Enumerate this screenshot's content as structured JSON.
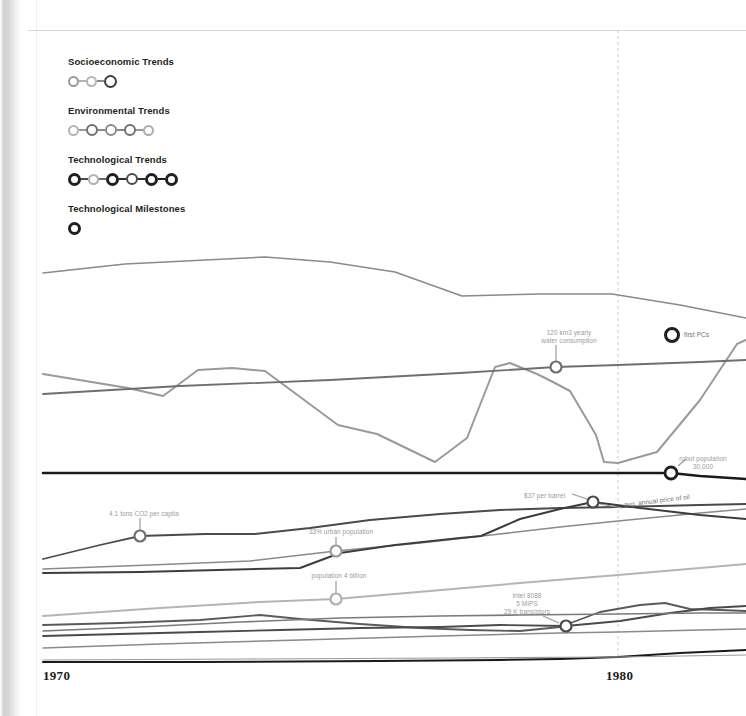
{
  "legend": {
    "blocks": [
      {
        "label": "Socioeconomic Trends",
        "nodes": [
          {
            "d": 11,
            "stroke": 2.0,
            "color": "#9a9a9a"
          },
          {
            "d": 11,
            "stroke": 2.0,
            "color": "#b5b5b5"
          },
          {
            "d": 13,
            "stroke": 2.6,
            "color": "#3d3d3d"
          }
        ],
        "connectors": [
          "#b0b0b0",
          "#8d8d8d"
        ]
      },
      {
        "label": "Environmental Trends",
        "nodes": [
          {
            "d": 11,
            "stroke": 2.0,
            "color": "#b5b5b5"
          },
          {
            "d": 12,
            "stroke": 2.3,
            "color": "#6f6f6f"
          },
          {
            "d": 12,
            "stroke": 2.2,
            "color": "#8a8a8a"
          },
          {
            "d": 12,
            "stroke": 2.3,
            "color": "#6f6f6f"
          },
          {
            "d": 11,
            "stroke": 2.0,
            "color": "#adadad"
          }
        ],
        "connectors": [
          "#9a9a9a",
          "#8a8a8a",
          "#8a8a8a",
          "#9a9a9a"
        ]
      },
      {
        "label": "Technological Trends",
        "nodes": [
          {
            "d": 13,
            "stroke": 3.0,
            "color": "#1f1f1f"
          },
          {
            "d": 11,
            "stroke": 2.0,
            "color": "#b0b0b0"
          },
          {
            "d": 13,
            "stroke": 3.0,
            "color": "#1f1f1f"
          },
          {
            "d": 12,
            "stroke": 2.5,
            "color": "#4a4a4a"
          },
          {
            "d": 13,
            "stroke": 3.0,
            "color": "#1f1f1f"
          },
          {
            "d": 13,
            "stroke": 3.0,
            "color": "#1f1f1f"
          }
        ],
        "connectors": [
          "#4a4a4a",
          "#6a6a6a",
          "#2b2b2b",
          "#2b2b2b",
          "#1f1f1f"
        ]
      },
      {
        "label": "Technological Milestones",
        "nodes": [
          {
            "d": 13,
            "stroke": 3.0,
            "color": "#1f1f1f"
          }
        ],
        "connectors": []
      }
    ]
  },
  "axis": {
    "ticks": [
      {
        "label": "1970",
        "x": 43,
        "y": 668
      },
      {
        "label": "1980",
        "x": 606,
        "y": 668
      }
    ],
    "gridline_x": 618,
    "gridline_color": "#cdcdcd"
  },
  "annotations": [
    {
      "name": "water-consumption",
      "text": "120 km3 yearly\nwater consumption",
      "x": 520,
      "y": 329,
      "w": 98,
      "marker": {
        "x": 556,
        "y": 367,
        "d": 11,
        "stroke": 2.2,
        "color": "#6f6f6f"
      },
      "stem": {
        "x1": 556,
        "y1": 345,
        "x2": 556,
        "y2": 362
      }
    },
    {
      "name": "first-pcs",
      "text": "first PCs",
      "x": 684,
      "y": 331,
      "w": 60,
      "align": "left",
      "tone": "dark",
      "marker": {
        "x": 672,
        "y": 335,
        "d": 13,
        "stroke": 3.0,
        "color": "#1f1f1f"
      },
      "stem": null
    },
    {
      "name": "robot-population",
      "text": "robot population\n30,000",
      "x": 660,
      "y": 455,
      "w": 86,
      "marker": {
        "x": 671,
        "y": 473,
        "d": 12,
        "stroke": 2.8,
        "color": "#1f1f1f"
      },
      "stem": {
        "x1": 678,
        "y1": 466,
        "x2": 686,
        "y2": 459
      }
    },
    {
      "name": "price-per-barrel",
      "text": "$37 per barrel",
      "x": 524,
      "y": 492,
      "w": 66,
      "align": "left",
      "marker": {
        "x": 593,
        "y": 502,
        "d": 11,
        "stroke": 2.2,
        "color": "#4a4a4a"
      },
      "stem": {
        "x1": 572,
        "y1": 494,
        "x2": 587,
        "y2": 499
      }
    },
    {
      "name": "avg-annual-price-of-oil",
      "text": "avg. annual price of oil",
      "x": 624,
      "y": 501,
      "w": 80,
      "align": "left",
      "tone": "dark",
      "rotate": true,
      "marker": null,
      "stem": {
        "x1": 600,
        "y1": 504,
        "x2": 622,
        "y2": 508
      }
    },
    {
      "name": "co2-per-capita",
      "text": "4.1 tons CO2 per capita",
      "x": 95,
      "y": 510,
      "w": 98,
      "marker": {
        "x": 140,
        "y": 536,
        "d": 11,
        "stroke": 2.2,
        "color": "#6f6f6f"
      },
      "stem": {
        "x1": 140,
        "y1": 518,
        "x2": 140,
        "y2": 531
      }
    },
    {
      "name": "urban-population",
      "text": "33% urban population",
      "x": 295,
      "y": 528,
      "w": 92,
      "marker": {
        "x": 336,
        "y": 551,
        "d": 11,
        "stroke": 2.2,
        "color": "#9a9a9a"
      },
      "stem": {
        "x1": 336,
        "y1": 537,
        "x2": 336,
        "y2": 546
      }
    },
    {
      "name": "world-population",
      "text": "population 4 billion",
      "x": 296,
      "y": 572,
      "w": 86,
      "marker": {
        "x": 336,
        "y": 599,
        "d": 11,
        "stroke": 2.2,
        "color": "#b0b0b0"
      },
      "stem": {
        "x1": 336,
        "y1": 581,
        "x2": 336,
        "y2": 594
      }
    },
    {
      "name": "intel-8088",
      "text": "Intel 8088\n5 MIPS\n29 K transistors",
      "x": 487,
      "y": 592,
      "w": 80,
      "marker": {
        "x": 566,
        "y": 626,
        "d": 11,
        "stroke": 2.2,
        "color": "#4a4a4a"
      },
      "stem": {
        "x1": 543,
        "y1": 616,
        "x2": 559,
        "y2": 623
      }
    }
  ],
  "chart_data": {
    "type": "line",
    "title": "",
    "xlabel": "",
    "ylabel": "",
    "xlim": [
      1970,
      1981
    ],
    "grid": false,
    "legend_position": "top-left",
    "x_pixel_range": [
      43,
      746
    ],
    "series": [
      {
        "name": "upper-grey-trend",
        "color": "#8a8a8a",
        "width": 1.6,
        "points": [
          [
            43,
            273
          ],
          [
            125,
            264
          ],
          [
            265,
            257
          ],
          [
            330,
            262
          ],
          [
            395,
            272
          ],
          [
            462,
            296
          ],
          [
            540,
            294
          ],
          [
            612,
            294
          ],
          [
            680,
            305
          ],
          [
            746,
            318
          ]
        ]
      },
      {
        "name": "water-consumption-zigzag",
        "color": "#9a9a9a",
        "width": 2.0,
        "points": [
          [
            43,
            374
          ],
          [
            128,
            388
          ],
          [
            163,
            396
          ],
          [
            198,
            370
          ],
          [
            232,
            368
          ],
          [
            265,
            371
          ],
          [
            338,
            425
          ],
          [
            377,
            434
          ],
          [
            435,
            462
          ],
          [
            467,
            438
          ],
          [
            495,
            367
          ],
          [
            510,
            363
          ],
          [
            537,
            374
          ],
          [
            551,
            381
          ],
          [
            570,
            391
          ],
          [
            596,
            435
          ],
          [
            604,
            462
          ],
          [
            618,
            463
          ],
          [
            657,
            452
          ],
          [
            700,
            400
          ],
          [
            737,
            344
          ],
          [
            746,
            340
          ]
        ]
      },
      {
        "name": "mid-grey-baseline",
        "color": "#6f6f6f",
        "width": 1.8,
        "points": [
          [
            43,
            394
          ],
          [
            180,
            386
          ],
          [
            330,
            380
          ],
          [
            460,
            373
          ],
          [
            556,
            367
          ],
          [
            618,
            365
          ],
          [
            700,
            362
          ],
          [
            746,
            360
          ]
        ]
      },
      {
        "name": "robot-population",
        "color": "#1a1a1a",
        "width": 2.6,
        "points": [
          [
            43,
            473
          ],
          [
            300,
            473
          ],
          [
            500,
            473
          ],
          [
            618,
            473
          ],
          [
            671,
            473
          ],
          [
            700,
            476
          ],
          [
            746,
            479
          ]
        ]
      },
      {
        "name": "co2-per-capita",
        "color": "#4a4a4a",
        "width": 1.8,
        "points": [
          [
            43,
            559
          ],
          [
            100,
            545
          ],
          [
            140,
            536
          ],
          [
            205,
            534
          ],
          [
            255,
            534
          ],
          [
            310,
            528
          ],
          [
            370,
            520
          ],
          [
            440,
            514
          ],
          [
            500,
            510
          ],
          [
            560,
            508
          ],
          [
            618,
            507
          ],
          [
            700,
            505
          ],
          [
            746,
            504
          ]
        ]
      },
      {
        "name": "urban-population",
        "color": "#8a8a8a",
        "width": 1.6,
        "points": [
          [
            43,
            569
          ],
          [
            150,
            565
          ],
          [
            250,
            561
          ],
          [
            336,
            551
          ],
          [
            420,
            543
          ],
          [
            500,
            534
          ],
          [
            560,
            527
          ],
          [
            618,
            521
          ],
          [
            700,
            513
          ],
          [
            746,
            509
          ]
        ]
      },
      {
        "name": "gdp-trend",
        "color": "#3d3d3d",
        "width": 2.0,
        "points": [
          [
            43,
            573
          ],
          [
            140,
            572
          ],
          [
            218,
            570
          ],
          [
            300,
            568
          ],
          [
            340,
            553
          ],
          [
            395,
            545
          ],
          [
            460,
            538
          ],
          [
            481,
            536
          ],
          [
            520,
            519
          ],
          [
            560,
            509
          ],
          [
            593,
            502
          ],
          [
            640,
            508
          ],
          [
            700,
            515
          ],
          [
            746,
            519
          ]
        ]
      },
      {
        "name": "world-population",
        "color": "#b5b5b5",
        "width": 2.0,
        "points": [
          [
            43,
            616
          ],
          [
            160,
            608
          ],
          [
            260,
            602
          ],
          [
            336,
            599
          ],
          [
            430,
            591
          ],
          [
            520,
            583
          ],
          [
            618,
            575
          ],
          [
            700,
            568
          ],
          [
            746,
            564
          ]
        ]
      },
      {
        "name": "compute-power",
        "color": "#5a5a5a",
        "width": 1.8,
        "points": [
          [
            43,
            625
          ],
          [
            120,
            623
          ],
          [
            200,
            620
          ],
          [
            260,
            615
          ],
          [
            300,
            619
          ],
          [
            360,
            624
          ],
          [
            420,
            628
          ],
          [
            470,
            630
          ],
          [
            520,
            631
          ],
          [
            560,
            627
          ],
          [
            600,
            612
          ],
          [
            640,
            605
          ],
          [
            665,
            603
          ],
          [
            690,
            609
          ],
          [
            720,
            610
          ],
          [
            746,
            611
          ]
        ]
      },
      {
        "name": "transistor-count",
        "color": "#4a4a4a",
        "width": 1.8,
        "points": [
          [
            43,
            636
          ],
          [
            120,
            634
          ],
          [
            200,
            632
          ],
          [
            280,
            630
          ],
          [
            360,
            628
          ],
          [
            440,
            627
          ],
          [
            500,
            625
          ],
          [
            566,
            626
          ],
          [
            620,
            621
          ],
          [
            670,
            613
          ],
          [
            710,
            608
          ],
          [
            746,
            606
          ]
        ]
      },
      {
        "name": "mips-line",
        "color": "#7a7a7a",
        "width": 1.6,
        "points": [
          [
            43,
            631
          ],
          [
            140,
            627
          ],
          [
            240,
            622
          ],
          [
            340,
            618
          ],
          [
            440,
            616
          ],
          [
            520,
            615
          ],
          [
            618,
            614
          ],
          [
            700,
            613
          ],
          [
            746,
            613
          ]
        ]
      },
      {
        "name": "lower-thin-line",
        "color": "#8a8a8a",
        "width": 1.4,
        "points": [
          [
            43,
            648
          ],
          [
            160,
            644
          ],
          [
            300,
            640
          ],
          [
            440,
            636
          ],
          [
            560,
            633
          ],
          [
            618,
            632
          ],
          [
            700,
            630
          ],
          [
            746,
            629
          ]
        ]
      },
      {
        "name": "baseline-black",
        "color": "#1a1a1a",
        "width": 2.0,
        "points": [
          [
            43,
            662
          ],
          [
            200,
            662
          ],
          [
            380,
            661
          ],
          [
            500,
            660
          ],
          [
            560,
            659
          ],
          [
            618,
            657
          ],
          [
            680,
            653
          ],
          [
            746,
            650
          ]
        ]
      },
      {
        "name": "baseline-thin",
        "color": "#9a9a9a",
        "width": 1.2,
        "points": [
          [
            43,
            660
          ],
          [
            250,
            659
          ],
          [
            450,
            658
          ],
          [
            618,
            657
          ],
          [
            746,
            655
          ]
        ]
      }
    ]
  }
}
